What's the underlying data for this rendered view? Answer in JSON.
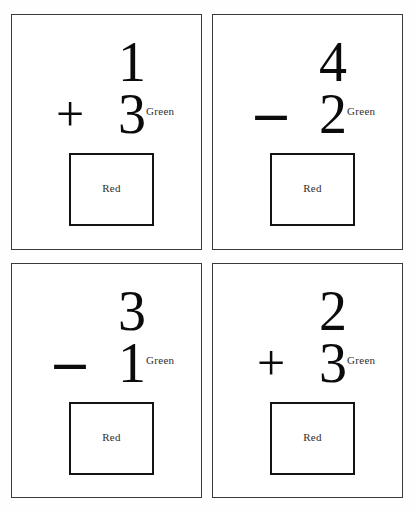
{
  "worksheet": {
    "background_color": "#ffffff",
    "card_border_color": "#3a3a3a",
    "box_border_color": "#141414",
    "digit_color": "#0b0b0b",
    "label_color": "#2e2e2e",
    "columns": 2,
    "rows": 2
  },
  "cards": [
    {
      "id": "card-1",
      "top_operand": "1",
      "operator": "+",
      "operator_name": "plus",
      "bottom_operand": "3",
      "green_label": "Green",
      "answer_label": "Red"
    },
    {
      "id": "card-2",
      "top_operand": "4",
      "operator": "–",
      "operator_name": "minus",
      "bottom_operand": "2",
      "green_label": "Green",
      "answer_label": "Red"
    },
    {
      "id": "card-3",
      "top_operand": "3",
      "operator": "–",
      "operator_name": "minus",
      "bottom_operand": "1",
      "green_label": "Green",
      "answer_label": "Red"
    },
    {
      "id": "card-4",
      "top_operand": "2",
      "operator": "+",
      "operator_name": "plus",
      "bottom_operand": "3",
      "green_label": "Green",
      "answer_label": "Red"
    }
  ]
}
